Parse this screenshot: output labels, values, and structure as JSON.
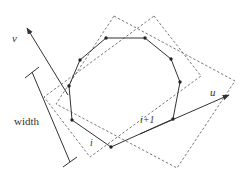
{
  "diagram": {
    "labels": {
      "v_axis": "v",
      "u_axis": "u",
      "width": "width",
      "edge_i": "i",
      "edge_i_plus_1": "i+1"
    },
    "colors": {
      "stroke": "#333333",
      "dashed": "#555555",
      "background": "#ffffff"
    },
    "polygon_vertices": [
      [
        111,
        147
      ],
      [
        173,
        119
      ],
      [
        180,
        82
      ],
      [
        171,
        59
      ],
      [
        145,
        38
      ],
      [
        106,
        38
      ],
      [
        80,
        60
      ],
      [
        69,
        86
      ],
      [
        72,
        120
      ]
    ],
    "dashed_rect_a": [
      [
        114,
        16
      ],
      [
        235,
        81
      ],
      [
        177,
        168
      ],
      [
        56,
        104
      ]
    ],
    "dashed_rect_b": [
      [
        154,
        16
      ],
      [
        201,
        76
      ],
      [
        90,
        157
      ],
      [
        44,
        97
      ]
    ]
  }
}
